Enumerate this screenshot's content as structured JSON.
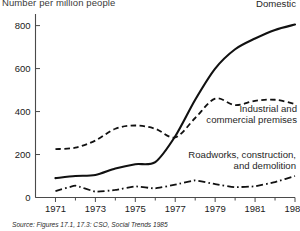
{
  "chart_data": {
    "type": "line",
    "title": "Number per million people",
    "ylabel": "Number per million people",
    "xlabel": "",
    "grid": false,
    "legend_position": "inline-annotations",
    "xlim": [
      1970,
      1983
    ],
    "ylim": [
      0,
      840
    ],
    "x": [
      1971,
      1972,
      1973,
      1974,
      1975,
      1976,
      1977,
      1978,
      1979,
      1980,
      1981,
      1982,
      1983
    ],
    "xticks": [
      1971,
      1972,
      1973,
      1974,
      1975,
      1976,
      1977,
      1978,
      1979,
      1980,
      1981,
      1982,
      1983
    ],
    "xtick_labels": [
      "1971",
      "",
      "1973",
      "",
      "1975",
      "",
      "1977",
      "",
      "1979",
      "",
      "1981",
      "",
      "1983"
    ],
    "yticks": [
      0,
      200,
      400,
      600,
      800
    ],
    "ytick_labels": [
      "0",
      "200",
      "400",
      "600",
      "800"
    ],
    "series": [
      {
        "name": "Domestic",
        "style": "solid",
        "color": "#111111",
        "values": [
          90,
          100,
          105,
          135,
          155,
          165,
          285,
          455,
          600,
          690,
          740,
          780,
          805
        ]
      },
      {
        "name": "Industrial and commercial premises",
        "style": "dashed",
        "color": "#111111",
        "values": [
          225,
          232,
          265,
          320,
          335,
          320,
          280,
          370,
          460,
          430,
          450,
          455,
          435
        ]
      },
      {
        "name": "Roadworks, construction, and demolition",
        "style": "dash-dot",
        "color": "#111111",
        "values": [
          30,
          55,
          27,
          35,
          52,
          42,
          60,
          80,
          62,
          48,
          52,
          72,
          100
        ]
      }
    ],
    "annotations": [
      {
        "id": "domestic",
        "text": "Domestic",
        "series": "Domestic"
      },
      {
        "id": "industrial",
        "text": "Industrial and\ncommercial premises",
        "series": "Industrial and commercial premises"
      },
      {
        "id": "roadworks",
        "text": "Roadworks, construction,\nand demolition",
        "series": "Roadworks, construction, and demolition"
      }
    ]
  },
  "axis": {
    "y_axis_caption": "Number per million people",
    "ytick_0": "0",
    "ytick_200": "200",
    "ytick_400": "400",
    "ytick_600": "600",
    "ytick_800": "800",
    "xtick_1971": "1971",
    "xtick_1973": "1973",
    "xtick_1975": "1975",
    "xtick_1977": "1977",
    "xtick_1979": "1979",
    "xtick_1981": "1981",
    "xtick_1983": "1983"
  },
  "labels": {
    "domestic": "Domestic",
    "industrial_line1": "Industrial and",
    "industrial_line2": "commercial premises",
    "roadworks_line1": "Roadworks, construction,",
    "roadworks_line2": "and demolition"
  },
  "footer": {
    "source": "Source: Figures 17.1, 17.3: CSO, Social Trends 1985"
  },
  "colors": {
    "ink": "#111111",
    "axis": "#4a4a4a",
    "background": "#ffffff"
  }
}
